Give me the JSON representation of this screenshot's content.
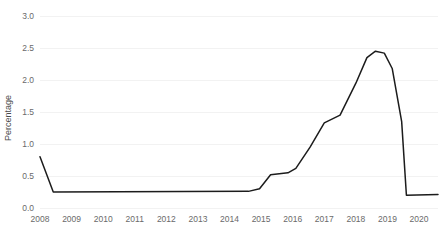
{
  "chart_data": {
    "type": "line",
    "title": "",
    "subtitle": "",
    "xlabel": "",
    "ylabel": "Percentage",
    "xlim": [
      2008,
      2020.6
    ],
    "ylim": [
      0.0,
      3.0
    ],
    "grid": true,
    "grid_axis": "y",
    "legend": false,
    "legend_position": "none",
    "line_color": "#1c1c1c",
    "grid_color": "#ededed",
    "background_color": "#ffffff",
    "tick_label_color": "#6a6a6a",
    "y_ticks": [
      "0.0",
      "0.5",
      "1.0",
      "1.5",
      "2.0",
      "2.5",
      "3.0"
    ],
    "y_tick_values": [
      0.0,
      0.5,
      1.0,
      1.5,
      2.0,
      2.5,
      3.0
    ],
    "x_ticks": [
      "2008",
      "2009",
      "2010",
      "2011",
      "2012",
      "2013",
      "2014",
      "2015",
      "2016",
      "2017",
      "2018",
      "2019",
      "2020"
    ],
    "x_tick_values": [
      2008,
      2009,
      2010,
      2011,
      2012,
      2013,
      2014,
      2015,
      2016,
      2017,
      2018,
      2019,
      2020
    ],
    "series": [
      {
        "name": "Percentage",
        "color": "#1c1c1c",
        "x": [
          2008.0,
          2008.42,
          2014.6,
          2014.95,
          2015.3,
          2015.85,
          2016.1,
          2016.55,
          2017.0,
          2017.5,
          2018.0,
          2018.35,
          2018.62,
          2018.9,
          2019.15,
          2019.45,
          2019.6,
          2020.6
        ],
        "values": [
          0.8,
          0.25,
          0.26,
          0.3,
          0.52,
          0.55,
          0.62,
          0.95,
          1.33,
          1.45,
          1.95,
          2.35,
          2.45,
          2.42,
          2.18,
          1.35,
          0.2,
          0.21
        ]
      }
    ],
    "annotations": []
  }
}
